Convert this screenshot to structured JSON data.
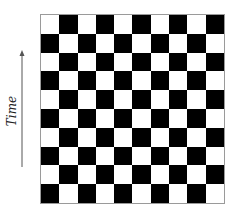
{
  "diagram": {
    "axis": {
      "label": "Time",
      "direction": "up"
    },
    "board": {
      "rows": 10,
      "cols": 10,
      "top_left_color": "white",
      "colors": {
        "light": "#ffffff",
        "dark": "#000000",
        "border": "#9a9a9a"
      }
    }
  }
}
